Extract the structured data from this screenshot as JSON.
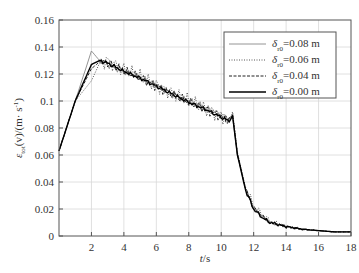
{
  "chart_data": {
    "type": "line",
    "title": "",
    "xlabel": "t/s",
    "ylabel": "ε_tot(v)/(m·s⁻¹)",
    "xlim": [
      0,
      18
    ],
    "ylim": [
      0,
      0.16
    ],
    "xticks": [
      2,
      4,
      6,
      8,
      10,
      12,
      14,
      16,
      18
    ],
    "yticks": [
      0,
      0.02,
      0.04,
      0.06,
      0.08,
      0.1,
      0.12,
      0.14,
      0.16
    ],
    "ytick_labels": [
      "0",
      "0.02",
      "0.04",
      "0.06",
      "0.08",
      "0.1",
      "0.12",
      "0.14",
      "0.16"
    ],
    "grid": true,
    "legend_position": "upper right",
    "x": [
      0,
      1,
      2,
      2.5,
      3,
      4,
      5,
      6,
      7,
      8,
      9,
      10,
      10.5,
      10.7,
      11,
      11.5,
      12,
      12.5,
      13,
      14,
      15,
      16,
      17,
      18
    ],
    "series": [
      {
        "name": "δ_r0=0.08 m",
        "style": "solid-thin",
        "color": "#888888",
        "values": [
          0.063,
          0.1,
          0.137,
          0.13,
          0.127,
          0.122,
          0.117,
          0.112,
          0.105,
          0.1,
          0.095,
          0.09,
          0.087,
          0.088,
          0.06,
          0.035,
          0.02,
          0.015,
          0.01,
          0.007,
          0.005,
          0.004,
          0.003,
          0.003
        ]
      },
      {
        "name": "δ_r0=0.06 m",
        "style": "dotted",
        "color": "#555555",
        "values": [
          0.063,
          0.1,
          0.115,
          0.128,
          0.13,
          0.123,
          0.118,
          0.112,
          0.106,
          0.1,
          0.094,
          0.089,
          0.085,
          0.092,
          0.062,
          0.036,
          0.022,
          0.016,
          0.011,
          0.007,
          0.005,
          0.004,
          0.003,
          0.003
        ]
      },
      {
        "name": "δ_r0=0.04 m",
        "style": "dashed",
        "color": "#222222",
        "values": [
          0.063,
          0.1,
          0.124,
          0.129,
          0.129,
          0.122,
          0.117,
          0.111,
          0.105,
          0.099,
          0.094,
          0.088,
          0.085,
          0.09,
          0.061,
          0.035,
          0.021,
          0.015,
          0.01,
          0.007,
          0.005,
          0.004,
          0.003,
          0.003
        ]
      },
      {
        "name": "δ_r0=0.00 m",
        "style": "solid-thick",
        "color": "#000000",
        "values": [
          0.063,
          0.1,
          0.127,
          0.13,
          0.128,
          0.122,
          0.117,
          0.111,
          0.105,
          0.099,
          0.094,
          0.088,
          0.085,
          0.089,
          0.06,
          0.034,
          0.02,
          0.014,
          0.01,
          0.007,
          0.005,
          0.004,
          0.003,
          0.003
        ]
      }
    ]
  },
  "legend": {
    "items": [
      {
        "symbol": "δ",
        "sub": "r0",
        "value": "=0.08 m"
      },
      {
        "symbol": "δ",
        "sub": "r0",
        "value": "=0.06 m"
      },
      {
        "symbol": "δ",
        "sub": "r0",
        "value": "=0.04 m"
      },
      {
        "symbol": "δ",
        "sub": "r0",
        "value": "=0.00 m"
      }
    ]
  },
  "axes": {
    "xlabel": "t/s",
    "ylabel_main": "ε",
    "ylabel_sub": "tot",
    "ylabel_rest": "(v)/(m· s",
    "ylabel_sup": "-1",
    "ylabel_close": ")"
  }
}
